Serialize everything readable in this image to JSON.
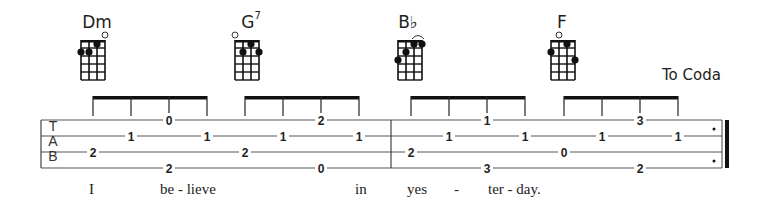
{
  "chords": [
    {
      "name": "Dm",
      "sup": "",
      "x": 97,
      "diagram_x": 81,
      "dots": [
        [
          0,
          2
        ],
        [
          1,
          2
        ],
        [
          2,
          1
        ]
      ],
      "open": [
        3
      ]
    },
    {
      "name": "G",
      "sup": "7",
      "x": 251,
      "diagram_x": 235,
      "dots": [
        [
          1,
          2
        ],
        [
          2,
          1
        ],
        [
          3,
          2
        ]
      ],
      "open": [
        0
      ]
    },
    {
      "name": "B♭",
      "sup": "",
      "x": 408,
      "diagram_x": 398,
      "dots": [
        [
          0,
          3
        ],
        [
          1,
          2
        ],
        [
          2,
          1
        ],
        [
          3,
          1
        ]
      ],
      "open": [],
      "barre": true
    },
    {
      "name": "F",
      "sup": "",
      "x": 562,
      "diagram_x": 551,
      "dots": [
        [
          0,
          2
        ],
        [
          2,
          1
        ],
        [
          3,
          3
        ]
      ],
      "open": [
        1
      ]
    }
  ],
  "to_coda_label": "To Coda",
  "tab_letters": [
    "T",
    "A",
    "B"
  ],
  "strings_y": [
    120,
    136,
    152,
    168
  ],
  "staff": {
    "x_start": 41,
    "x_end": 722,
    "barline_x": 391
  },
  "beams": [
    {
      "x1": 93,
      "x2": 207,
      "stems": [
        93,
        131,
        169,
        207
      ]
    },
    {
      "x1": 245,
      "x2": 359,
      "stems": [
        245,
        283,
        321,
        359
      ]
    },
    {
      "x1": 411,
      "x2": 525,
      "stems": [
        411,
        449,
        487,
        525
      ]
    },
    {
      "x1": 564,
      "x2": 678,
      "stems": [
        564,
        602,
        640,
        678
      ]
    }
  ],
  "notes": [
    {
      "x": 93,
      "string": 2,
      "fret": "2"
    },
    {
      "x": 131,
      "string": 1,
      "fret": "1"
    },
    {
      "x": 169,
      "string": 0,
      "fret": "0"
    },
    {
      "x": 169,
      "string": 3,
      "fret": "2"
    },
    {
      "x": 207,
      "string": 1,
      "fret": "1"
    },
    {
      "x": 245,
      "string": 2,
      "fret": "2"
    },
    {
      "x": 283,
      "string": 1,
      "fret": "1"
    },
    {
      "x": 321,
      "string": 0,
      "fret": "2"
    },
    {
      "x": 321,
      "string": 3,
      "fret": "0"
    },
    {
      "x": 359,
      "string": 1,
      "fret": "1"
    },
    {
      "x": 411,
      "string": 2,
      "fret": "2"
    },
    {
      "x": 449,
      "string": 1,
      "fret": "1"
    },
    {
      "x": 487,
      "string": 0,
      "fret": "1"
    },
    {
      "x": 487,
      "string": 3,
      "fret": "3"
    },
    {
      "x": 525,
      "string": 1,
      "fret": "1"
    },
    {
      "x": 564,
      "string": 2,
      "fret": "0"
    },
    {
      "x": 602,
      "string": 1,
      "fret": "1"
    },
    {
      "x": 640,
      "string": 0,
      "fret": "3"
    },
    {
      "x": 640,
      "string": 3,
      "fret": "2"
    },
    {
      "x": 678,
      "string": 1,
      "fret": "1"
    }
  ],
  "lyrics": [
    {
      "text": "I",
      "x": 93
    },
    {
      "text": "be - lieve",
      "x": 164
    },
    {
      "text": "in",
      "x": 359
    },
    {
      "text": "yes",
      "x": 411
    },
    {
      "text": "-",
      "x": 458
    },
    {
      "text": "ter - day.",
      "x": 492
    }
  ]
}
